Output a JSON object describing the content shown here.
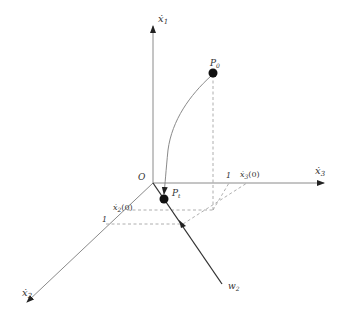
{
  "diagram": {
    "origin_label": "O",
    "axes": {
      "x1": {
        "label": "ẋ",
        "sub": "1"
      },
      "x2": {
        "label": "ẋ",
        "sub": "2"
      },
      "x3": {
        "label": "ẋ",
        "sub": "3"
      }
    },
    "points": {
      "p0": {
        "label": "P",
        "sub": "0"
      },
      "p1": {
        "label": "P",
        "sub": "t"
      }
    },
    "line_w2": {
      "label": "w",
      "sub": "2"
    },
    "ticks": {
      "x3_one": "1",
      "x3_initial": "ẋ",
      "x3_initial_sub": "3",
      "x3_initial_suffix": "(0)",
      "x2_one": "1",
      "x2_initial": "ẋ",
      "x2_initial_sub": "2",
      "x2_initial_suffix": "(0)"
    },
    "colors": {
      "axis": "#8a8a8a",
      "point": "#111111",
      "line": "#333333"
    }
  }
}
